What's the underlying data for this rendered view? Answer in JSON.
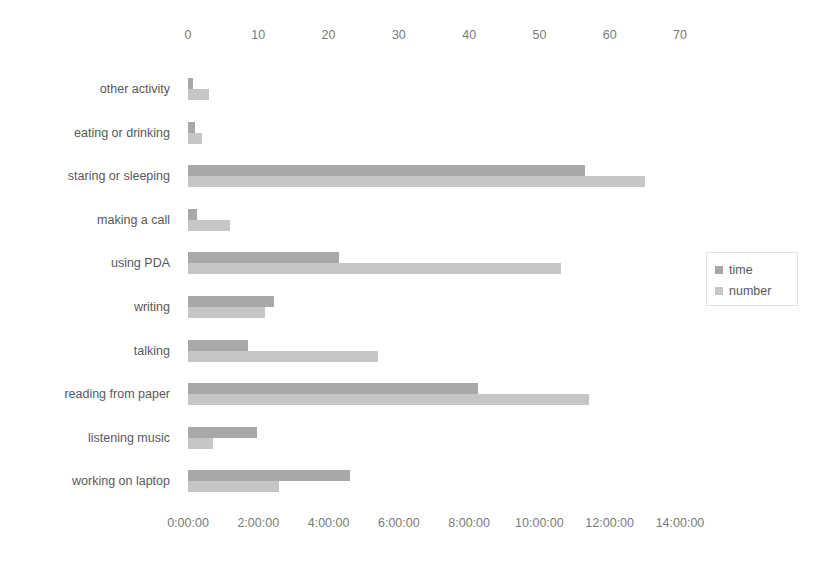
{
  "chart_data": {
    "type": "bar",
    "orientation": "horizontal",
    "title": "",
    "categories": [
      "other activity",
      "eating or drinking",
      "staring or sleeping",
      "making a call",
      "using PDA",
      "writing",
      "talking",
      "reading from paper",
      "listening music",
      "working on laptop"
    ],
    "series": [
      {
        "name": "time",
        "axis": "bottom",
        "unit": "h:mm:ss",
        "color": "#a8a8a8",
        "values_hours": [
          0.15,
          0.2,
          11.3,
          0.25,
          4.3,
          2.45,
          1.7,
          8.25,
          1.95,
          4.6
        ],
        "values_labels": [
          "0:09:00",
          "0:12:00",
          "11:18:00",
          "0:15:00",
          "4:18:00",
          "2:27:00",
          "1:42:00",
          "8:15:00",
          "1:57:00",
          "4:36:00"
        ]
      },
      {
        "name": "number",
        "axis": "top",
        "unit": "count",
        "color": "#c6c6c6",
        "values": [
          3,
          2,
          65,
          6,
          53,
          11,
          27,
          57,
          3.5,
          13
        ]
      }
    ],
    "top_axis": {
      "label": "number",
      "ticks": [
        "0",
        "10",
        "20",
        "30",
        "40",
        "50",
        "60",
        "70"
      ],
      "min": 0,
      "max": 70,
      "step": 10
    },
    "bottom_axis": {
      "label": "time",
      "ticks": [
        "0:00:00",
        "2:00:00",
        "4:00:00",
        "6:00:00",
        "8:00:00",
        "10:00:00",
        "12:00:00",
        "14:00:00"
      ],
      "min_hours": 0,
      "max_hours": 14,
      "step_hours": 2
    },
    "legend": {
      "position": "right",
      "entries": [
        {
          "label": "time",
          "color": "#a8a8a8"
        },
        {
          "label": "number",
          "color": "#c6c6c6"
        }
      ]
    },
    "grid": false
  }
}
